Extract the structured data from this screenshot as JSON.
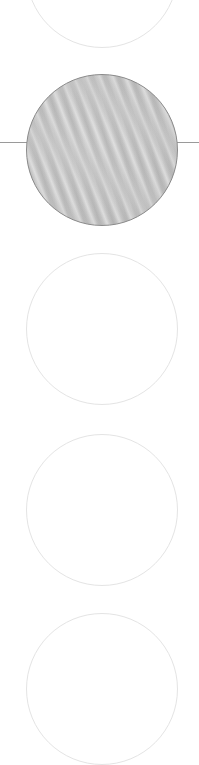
{
  "swatch_picker": {
    "selected_index": 1,
    "colors": {
      "selected_fill": "#c4c4c4",
      "selected_border": "#8a8a8a",
      "unselected_border": "#e4e4e4",
      "indicator_line": "#9a9a9a",
      "background": "#ffffff"
    },
    "swatches": [
      {
        "name": "swatch-1",
        "texture": "none",
        "selected": false
      },
      {
        "name": "swatch-2",
        "texture": "gray-moire-wood-grain",
        "selected": true
      },
      {
        "name": "swatch-3",
        "texture": "none",
        "selected": false
      },
      {
        "name": "swatch-4",
        "texture": "none",
        "selected": false
      },
      {
        "name": "swatch-5",
        "texture": "none",
        "selected": false
      }
    ]
  }
}
